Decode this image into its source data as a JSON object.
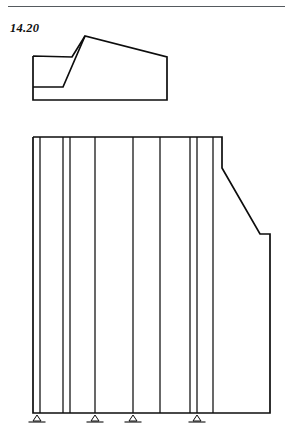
{
  "page": {
    "width": 293,
    "height": 442,
    "background": "#ffffff",
    "ink_color": "#0d0d0d",
    "rule_color": "#555a5e"
  },
  "figure": {
    "label": "14.20",
    "caption": "",
    "type": "line-drawing"
  },
  "top_rule": {
    "x": 8,
    "y": 6,
    "width": 277,
    "height": 1
  },
  "upper_shape": {
    "name": "profile-view",
    "points": "33,56 72,57 85,36 167,57 167,100 33,100 33,56",
    "inner_points": "33,87 63,87 85,36",
    "vertices": [
      {
        "x": 33,
        "y": 56
      },
      {
        "x": 72,
        "y": 57
      },
      {
        "x": 85,
        "y": 36
      },
      {
        "x": 167,
        "y": 57
      },
      {
        "x": 167,
        "y": 100
      },
      {
        "x": 33,
        "y": 100
      }
    ]
  },
  "lower_shape": {
    "name": "elevation-view",
    "outline_points": "33,137 222,137 222,168 260,234 270,234 270,413 33,413 33,137",
    "top_y": 137,
    "bottom_y": 413,
    "left_x": 33,
    "right_x": 270
  },
  "mullions": {
    "label": "vertical-lines",
    "x_positions": [
      40,
      63,
      70,
      95,
      133,
      160,
      190,
      197,
      213
    ],
    "top_y": 137,
    "bottom_y": 413
  },
  "supports": {
    "label": "support-symbols",
    "count": 4,
    "baseline_y": 413,
    "items": [
      {
        "cx": 37,
        "width": 17
      },
      {
        "cx": 95,
        "width": 17
      },
      {
        "cx": 133,
        "width": 17
      },
      {
        "cx": 197,
        "width": 17
      }
    ]
  },
  "chart_data": {
    "type": "table",
    "title": "14.20",
    "xlabel": "",
    "ylabel": "",
    "categories": [
      "profile-view",
      "elevation-view"
    ],
    "values": [
      1,
      1
    ]
  }
}
